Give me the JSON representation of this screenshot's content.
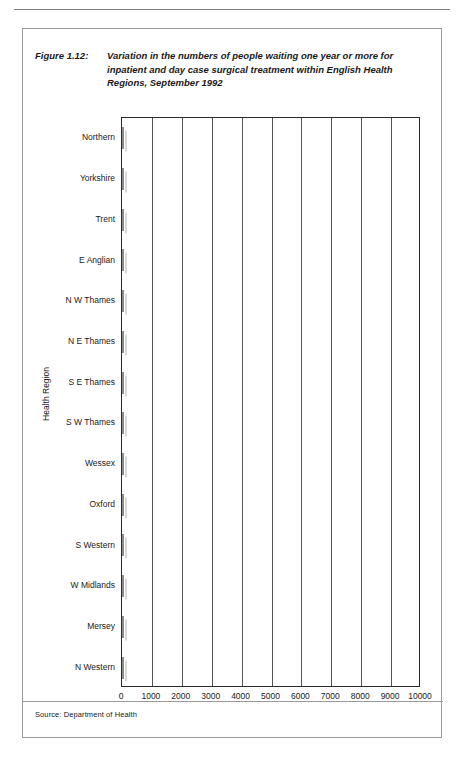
{
  "page": {
    "folio": ""
  },
  "figure": {
    "label": "Figure 1.12:",
    "title": "Variation in the numbers of people waiting one year or more for inpatient and day case surgical treatment within English Health Regions, September 1992",
    "source": "Source: Department of Health"
  },
  "colors": {
    "bar_fill": "#d2d2d2",
    "bar_border": "#8c8c8c",
    "axis": "#2a2a2a",
    "gridline": "#555555",
    "frame": "#9a9a9a"
  },
  "chart_data": {
    "type": "bar",
    "orientation": "horizontal",
    "title": "Variation in the numbers of people waiting one year or more for inpatient and day case surgical treatment within English Health Regions, September 1992",
    "xlabel": "",
    "ylabel": "Health Region",
    "categories": [
      "Northern",
      "Yorkshire",
      "Trent",
      "E Anglian",
      "N W Thames",
      "N E Thames",
      "S E Thames",
      "S W Thames",
      "Wessex",
      "Oxford",
      "S Western",
      "W Midlands",
      "Mersey",
      "N Western"
    ],
    "values": [
      4700,
      7200,
      10100,
      2950,
      5200,
      8500,
      8000,
      3400,
      4050,
      4800,
      3600,
      6300,
      1000,
      7900
    ],
    "xlim": [
      0,
      10000
    ],
    "xticks": [
      0,
      1000,
      2000,
      3000,
      4000,
      5000,
      6000,
      7000,
      8000,
      9000,
      10000
    ],
    "xtick_labels": [
      "0",
      "1000",
      "2000",
      "3000",
      "4000",
      "5000",
      "6000",
      "7000",
      "8000",
      "9000",
      "10000"
    ],
    "grid": "vertical",
    "legend": "none"
  }
}
